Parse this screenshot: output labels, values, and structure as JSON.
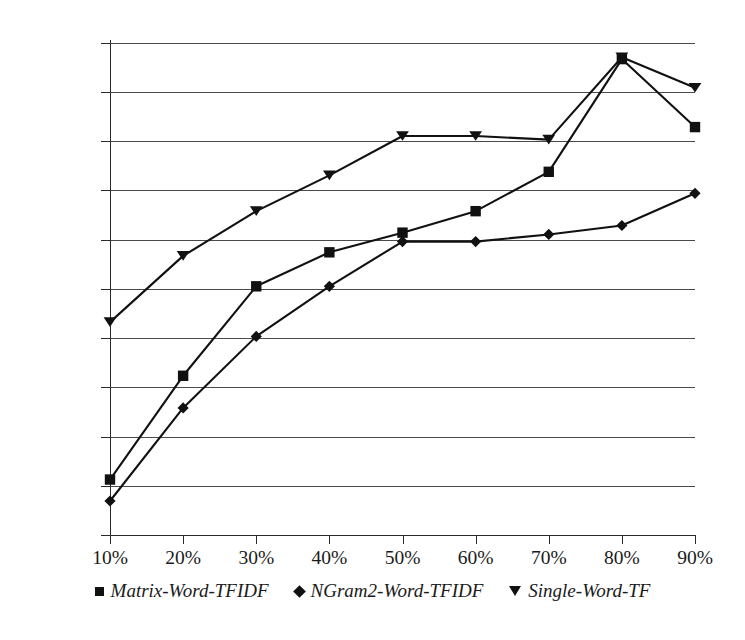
{
  "chart_data": {
    "type": "line",
    "title": "",
    "subtitle": "",
    "xlabel": "",
    "ylabel": "",
    "grid": true,
    "legend_position": "bottom",
    "x": [
      "10%",
      "20%",
      "30%",
      "40%",
      "50%",
      "60%",
      "70%",
      "80%",
      "90%"
    ],
    "categories": [
      "10%",
      "20%",
      "30%",
      "40%",
      "50%",
      "60%",
      "70%",
      "80%",
      "90%"
    ],
    "y_tick_labels": [
      "75.0%",
      "75.5%",
      "70.0%",
      "67.5%",
      "65.0%",
      "62.5%",
      "60.0%",
      "57.5%",
      "55.0%",
      "52.5%",
      "50.0%"
    ],
    "y_tick_positions": [
      43,
      92,
      141,
      190,
      240,
      289,
      338,
      387,
      437,
      486,
      535
    ],
    "ylim": [
      50.0,
      77.5
    ],
    "series": [
      {
        "name": "Matrix-Word-TFIDF",
        "marker": "square",
        "color": "#111111",
        "values": [
          53.1,
          58.9,
          63.9,
          65.8,
          66.9,
          68.1,
          70.3,
          76.6,
          72.8
        ]
      },
      {
        "name": "NGram2-Word-TFIDF",
        "marker": "diamond",
        "color": "#111111",
        "values": [
          51.9,
          57.1,
          61.1,
          63.9,
          66.4,
          66.4,
          66.8,
          67.3,
          69.1
        ]
      },
      {
        "name": "Single-Word-TF",
        "marker": "triangle-down",
        "color": "#111111",
        "values": [
          61.9,
          65.6,
          68.1,
          70.1,
          72.3,
          72.3,
          72.1,
          76.7,
          75.0
        ]
      }
    ]
  },
  "legend": {
    "items": [
      {
        "label": "Matrix-Word-TFIDF",
        "marker": "square-marker-icon"
      },
      {
        "label": "NGram2-Word-TFIDF",
        "marker": "diamond-marker-icon"
      },
      {
        "label": "Single-Word-TF",
        "marker": "triangle-down-marker-icon"
      }
    ]
  }
}
